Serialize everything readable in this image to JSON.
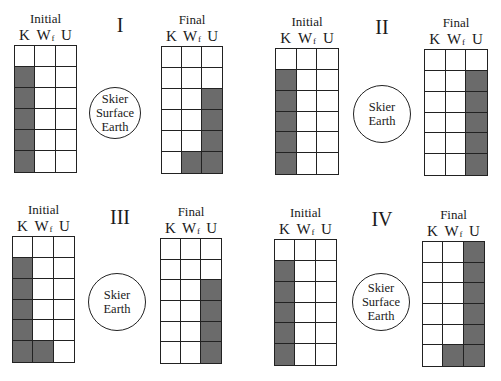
{
  "diagram": {
    "type": "energy bar charts (work-energy)",
    "column_labels": [
      "K",
      "W",
      "U"
    ],
    "column_label_subscripts": [
      "",
      "f",
      ""
    ],
    "shade_color": "#6b6b6b",
    "rows_per_chart": 6
  },
  "panels": [
    {
      "id": "I",
      "roman": "I",
      "system": [
        "Skier",
        "Surface",
        "Earth"
      ],
      "initial": {
        "title": "Initial",
        "K": 5,
        "Wf": 0,
        "U": 0
      },
      "final": {
        "title": "Final",
        "K": 0,
        "Wf": 1,
        "U": 4
      }
    },
    {
      "id": "II",
      "roman": "II",
      "system": [
        "Skier",
        "Earth"
      ],
      "initial": {
        "title": "Initial",
        "K": 5,
        "Wf": 0,
        "U": 0
      },
      "final": {
        "title": "Final",
        "K": 0,
        "Wf": 0,
        "U": 5
      }
    },
    {
      "id": "III",
      "roman": "III",
      "system": [
        "Skier",
        "Earth"
      ],
      "initial": {
        "title": "Initial",
        "K": 5,
        "Wf": 1,
        "U": 0
      },
      "final": {
        "title": "Final",
        "K": 0,
        "Wf": 0,
        "U": 4
      }
    },
    {
      "id": "IV",
      "roman": "IV",
      "system": [
        "Skier",
        "Surface",
        "Earth"
      ],
      "initial": {
        "title": "Initial",
        "K": 5,
        "Wf": 0,
        "U": 0
      },
      "final": {
        "title": "Final",
        "K": 0,
        "Wf": 1,
        "U": 6
      }
    }
  ],
  "layout": {
    "charts": [
      {
        "panel": 0,
        "which": "initial",
        "x": 14,
        "y": 45,
        "w": 63,
        "h": 128
      },
      {
        "panel": 0,
        "which": "final",
        "x": 161,
        "y": 46,
        "w": 62,
        "h": 128
      },
      {
        "panel": 1,
        "which": "initial",
        "x": 275,
        "y": 48,
        "w": 64,
        "h": 127
      },
      {
        "panel": 1,
        "which": "final",
        "x": 424,
        "y": 49,
        "w": 64,
        "h": 127
      },
      {
        "panel": 2,
        "which": "initial",
        "x": 12,
        "y": 236,
        "w": 63,
        "h": 127
      },
      {
        "panel": 2,
        "which": "final",
        "x": 160,
        "y": 238,
        "w": 62,
        "h": 126
      },
      {
        "panel": 3,
        "which": "initial",
        "x": 274,
        "y": 239,
        "w": 63,
        "h": 127
      },
      {
        "panel": 3,
        "which": "final",
        "x": 422,
        "y": 241,
        "w": 63,
        "h": 126
      }
    ],
    "romans": [
      {
        "panel": 0,
        "x": 95,
        "y": 14
      },
      {
        "panel": 1,
        "x": 357,
        "y": 16
      },
      {
        "panel": 2,
        "x": 95,
        "y": 206
      },
      {
        "panel": 3,
        "x": 357,
        "y": 208
      }
    ],
    "circles": [
      {
        "panel": 0,
        "cx": 115,
        "cy": 113,
        "r": 26
      },
      {
        "panel": 1,
        "cx": 382,
        "cy": 114,
        "r": 29
      },
      {
        "panel": 2,
        "cx": 117,
        "cy": 302,
        "r": 29
      },
      {
        "panel": 3,
        "cx": 381,
        "cy": 302,
        "r": 29
      }
    ]
  }
}
